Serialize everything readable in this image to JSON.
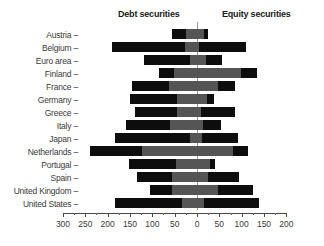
{
  "headers": {
    "left": "Debt securities",
    "right": "Equity securities"
  },
  "axis": {
    "tick_labels": [
      "300",
      "250",
      "200",
      "150",
      "100",
      "50",
      "0",
      "50",
      "100",
      "150",
      "200"
    ],
    "tick_values": [
      -300,
      -250,
      -200,
      -150,
      -100,
      -50,
      0,
      50,
      100,
      150,
      200
    ],
    "dash": "–"
  },
  "chart_data": {
    "type": "bar",
    "orientation": "horizontal",
    "title": "",
    "subtitle": "",
    "xlabel": "",
    "ylabel": "",
    "xlim": [
      -300,
      200
    ],
    "grid": false,
    "zero_line": true,
    "legend_position": "top",
    "panel_headers": [
      "Debt securities",
      "Equity securities"
    ],
    "xtick_labels": [
      "300",
      "250",
      "200",
      "150",
      "100",
      "50",
      "0",
      "50",
      "100",
      "150",
      "200"
    ],
    "note": "Stacked diverging bars. Negative axis (left of 0) = Debt securities, positive axis (right of 0) = Equity securities. Each side split into a dark outer segment and a gray inner segment.",
    "series": [
      {
        "name": "debt-outer-dark",
        "color": "#0d0d0d"
      },
      {
        "name": "debt-inner-gray",
        "color": "#555555"
      },
      {
        "name": "equity-inner-gray",
        "color": "#555555"
      },
      {
        "name": "equity-outer-dark",
        "color": "#0d0d0d"
      }
    ],
    "categories": [
      "Austria",
      "Belgium",
      "Euro area",
      "Finland",
      "France",
      "Germany",
      "Greece",
      "Italy",
      "Japan",
      "Netherlands",
      "Portugal",
      "Spain",
      "United Kingdom",
      "United States"
    ],
    "rows": [
      {
        "label": "Austria",
        "debt_total": 56,
        "debt_dark": 31,
        "debt_gray": 25,
        "equity_total": 25,
        "equity_gray": 16,
        "equity_dark": 9
      },
      {
        "label": "Belgium",
        "debt_total": 191,
        "debt_dark": 164,
        "debt_gray": 27,
        "equity_total": 110,
        "equity_gray": 4,
        "equity_dark": 106
      },
      {
        "label": "Euro area",
        "debt_total": 119,
        "debt_dark": 104,
        "debt_gray": 15,
        "equity_total": 55,
        "equity_gray": 20,
        "equity_dark": 35
      },
      {
        "label": "Finland",
        "debt_total": 85,
        "debt_dark": 33,
        "debt_gray": 52,
        "equity_total": 135,
        "equity_gray": 99,
        "equity_dark": 36
      },
      {
        "label": "France",
        "debt_total": 146,
        "debt_dark": 84,
        "debt_gray": 62,
        "equity_total": 86,
        "equity_gray": 46,
        "equity_dark": 40
      },
      {
        "label": "Germany",
        "debt_total": 149,
        "debt_dark": 104,
        "debt_gray": 45,
        "equity_total": 38,
        "equity_gray": 23,
        "equity_dark": 15
      },
      {
        "label": "Greece",
        "debt_total": 139,
        "debt_dark": 94,
        "debt_gray": 45,
        "equity_total": 86,
        "equity_gray": 9,
        "equity_dark": 77
      },
      {
        "label": "Italy",
        "debt_total": 159,
        "debt_dark": 99,
        "debt_gray": 60,
        "equity_total": 54,
        "equity_gray": 14,
        "equity_dark": 40
      },
      {
        "label": "Japan",
        "debt_total": 184,
        "debt_dark": 169,
        "debt_gray": 15,
        "equity_total": 92,
        "equity_gray": 12,
        "equity_dark": 80
      },
      {
        "label": "Netherlands",
        "debt_total": 240,
        "debt_dark": 116,
        "debt_gray": 124,
        "equity_total": 114,
        "equity_gray": 80,
        "equity_dark": 34
      },
      {
        "label": "Portugal",
        "debt_total": 153,
        "debt_dark": 106,
        "debt_gray": 47,
        "equity_total": 40,
        "equity_gray": 30,
        "equity_dark": 10
      },
      {
        "label": "Spain",
        "debt_total": 134,
        "debt_dark": 79,
        "debt_gray": 55,
        "equity_total": 95,
        "equity_gray": 25,
        "equity_dark": 70
      },
      {
        "label": "United Kingdom",
        "debt_total": 106,
        "debt_dark": 50,
        "debt_gray": 56,
        "equity_total": 126,
        "equity_gray": 46,
        "equity_dark": 80
      },
      {
        "label": "United States",
        "debt_total": 184,
        "debt_dark": 150,
        "debt_gray": 34,
        "equity_total": 139,
        "equity_gray": 16,
        "equity_dark": 123
      }
    ]
  }
}
